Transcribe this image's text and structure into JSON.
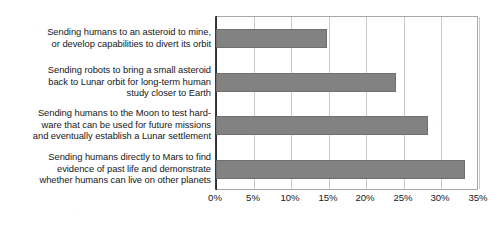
{
  "chart_data": {
    "type": "bar",
    "orientation": "horizontal",
    "title": "",
    "xlabel": "",
    "ylabel": "",
    "grid": true,
    "legend": false,
    "xlim": [
      0,
      35
    ],
    "xticks": [
      0,
      5,
      10,
      15,
      20,
      25,
      30,
      35
    ],
    "xtick_labels": [
      "0%",
      "5%",
      "10%",
      "15%",
      "20%",
      "25%",
      "30%",
      "35%"
    ],
    "categories": [
      "Sending humans to an asteroid to mine, or develop capabilities to divert its orbit",
      "Sending robots to bring a small asteroid back to Lunar orbit for long-term human study closer to Earth",
      "Sending humans to the Moon to test hardware that can be used for future missions and eventually establish a Lunar settlement",
      "Sending humans directly to Mars to find evidence of past life and demonstrate whether humans can live on other planets"
    ],
    "category_lines": [
      [
        "Sending humans to an asteroid to mine,",
        "or develop capabilities to divert its orbit"
      ],
      [
        "Sending robots to bring a small asteroid",
        "back to Lunar orbit for long-term human",
        "study closer to Earth"
      ],
      [
        "Sending humans to the Moon to test hard-",
        "ware that can be used for future missions",
        "and eventually establish a Lunar settlement"
      ],
      [
        "Sending humans directly to Mars to find",
        "evidence of past life and demonstrate",
        "whether humans can live on other planets"
      ]
    ],
    "values": [
      14.8,
      24.0,
      28.2,
      33.2
    ],
    "bar_color": "#828282",
    "bar_border_color": "#6f6f6f",
    "gridline_color": "#c9c9c9",
    "axis_color": "#2f2f2f",
    "plot_border_color": "#a8a8a8",
    "background_color": "#ffffff"
  }
}
